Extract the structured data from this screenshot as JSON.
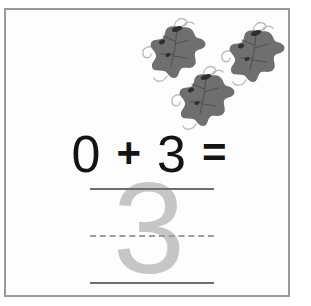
{
  "worksheet": {
    "type": "math-addition-tracing-worksheet",
    "border_color": "#9a9a9a",
    "background_color": "#fdfdfd"
  },
  "illustration": {
    "name": "grape-leaf-cluster",
    "count": 3,
    "color": "#6f6f6f",
    "accent_color": "#b7b7b7",
    "items": [
      {
        "label": "grape-leaf-1"
      },
      {
        "label": "grape-leaf-2"
      },
      {
        "label": "grape-leaf-3"
      }
    ]
  },
  "equation": {
    "operand_left": "0",
    "operator": "+",
    "operand_right": "3",
    "equals": "=",
    "text_color": "#141414"
  },
  "answer": {
    "trace_numeral": "3",
    "trace_color": "#c6c6c6",
    "guide_lines": {
      "top_style": "solid",
      "middle_style": "dashed",
      "bottom_style": "solid",
      "line_color": "#6d6d6d",
      "dashed_color": "#9d9d9d"
    }
  }
}
